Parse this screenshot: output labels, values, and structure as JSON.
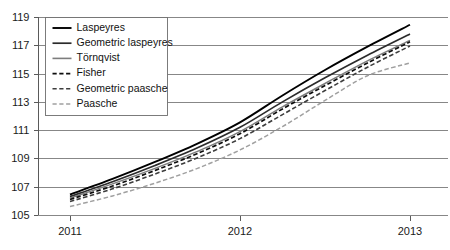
{
  "chart_data": {
    "type": "line",
    "title": "",
    "subtitle": "",
    "xlabel": "",
    "ylabel": "",
    "grid": true,
    "legend_position": "top-left",
    "x": [
      2011,
      2013
    ],
    "x_ticks": [
      "2011",
      "2012",
      "2013"
    ],
    "x_tick_values": [
      2011,
      2012,
      2013
    ],
    "xlim": [
      2011,
      2013
    ],
    "ylim": [
      105,
      119
    ],
    "y_ticks": [
      "105",
      "107",
      "109",
      "111",
      "113",
      "115",
      "117",
      "119"
    ],
    "y_tick_values": [
      105,
      107,
      109,
      111,
      113,
      115,
      117,
      119
    ],
    "series": [
      {
        "name": "Laspeyres",
        "color": "#000000",
        "style": "solid",
        "width": 1.9,
        "x": [
          2011.0,
          2011.25,
          2011.5,
          2011.75,
          2012.0,
          2012.25,
          2012.5,
          2012.75,
          2013.0
        ],
        "values": [
          106.45,
          107.55,
          108.75,
          110.05,
          111.55,
          113.45,
          115.25,
          116.9,
          118.45
        ]
      },
      {
        "name": "Geometric laspeyres",
        "color": "#2b2b2b",
        "style": "solid",
        "width": 1.7,
        "x": [
          2011.0,
          2011.25,
          2011.5,
          2011.75,
          2012.0,
          2012.25,
          2012.5,
          2012.75,
          2013.0
        ],
        "values": [
          106.3,
          107.35,
          108.5,
          109.75,
          111.2,
          113.0,
          114.7,
          116.3,
          117.8
        ]
      },
      {
        "name": "Törnqvist",
        "color": "#7d7d7d",
        "style": "solid",
        "width": 1.5,
        "x": [
          2011.0,
          2011.25,
          2011.5,
          2011.75,
          2012.0,
          2012.25,
          2012.5,
          2012.75,
          2013.0
        ],
        "values": [
          106.2,
          107.2,
          108.3,
          109.5,
          110.9,
          112.65,
          114.3,
          115.9,
          117.35
        ]
      },
      {
        "name": "Fisher",
        "color": "#0d0d0d",
        "style": "dashed",
        "width": 1.7,
        "x": [
          2011.0,
          2011.25,
          2011.5,
          2011.75,
          2012.0,
          2012.25,
          2012.5,
          2012.75,
          2013.0
        ],
        "values": [
          106.1,
          107.05,
          108.15,
          109.35,
          110.75,
          112.5,
          114.15,
          115.75,
          117.25
        ]
      },
      {
        "name": "Geometric paasche",
        "color": "#3d3d3d",
        "style": "dashed",
        "width": 1.6,
        "x": [
          2011.0,
          2011.25,
          2011.5,
          2011.75,
          2012.0,
          2012.25,
          2012.5,
          2012.75,
          2013.0
        ],
        "values": [
          105.95,
          106.85,
          107.9,
          109.05,
          110.4,
          112.1,
          113.8,
          115.45,
          116.95
        ]
      },
      {
        "name": "Paasche",
        "color": "#a0a0a0",
        "style": "dashed",
        "width": 1.5,
        "x": [
          2011.0,
          2011.25,
          2011.5,
          2011.75,
          2012.0,
          2012.25,
          2012.5,
          2012.75,
          2013.0
        ],
        "values": [
          105.6,
          106.35,
          107.25,
          108.3,
          109.6,
          111.25,
          113.1,
          114.85,
          115.75
        ]
      }
    ]
  }
}
